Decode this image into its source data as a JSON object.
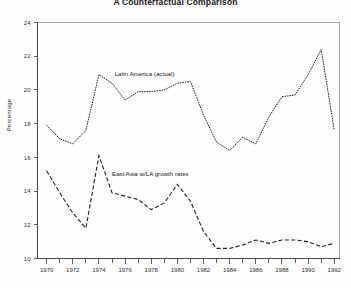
{
  "chart_data": {
    "type": "line",
    "title": "A Counterfactual Comparison",
    "xlabel": "",
    "ylabel": "Percentage",
    "xlim": [
      1969.3,
      1992.4
    ],
    "ylim": [
      10,
      24
    ],
    "grid": false,
    "legend_position": "inline-annotation",
    "x_tick_step_minor": 1,
    "x_tick_step_major": 2,
    "y_tick_step": 2,
    "xticks": [
      1970,
      1972,
      1974,
      1976,
      1978,
      1980,
      1982,
      1984,
      1986,
      1988,
      1990,
      1992
    ],
    "xtick_labels": [
      "1970",
      "1972",
      "1974",
      "1976",
      "1978",
      "1980",
      "1982",
      "1984",
      "1986",
      "1988",
      "1990",
      "1992"
    ],
    "yticks": [
      10,
      12,
      14,
      16,
      18,
      20,
      22,
      24
    ],
    "ytick_labels": [
      "10",
      "12",
      "14",
      "16",
      "18",
      "20",
      "22",
      "24"
    ],
    "x": [
      1970,
      1971,
      1972,
      1973,
      1974,
      1975,
      1976,
      1977,
      1978,
      1979,
      1980,
      1981,
      1982,
      1983,
      1984,
      1985,
      1986,
      1987,
      1988,
      1989,
      1990,
      1991,
      1992
    ],
    "series": [
      {
        "name": "Latin America (actual)",
        "style": "dotted",
        "annotation": "Latin America (actual)",
        "values": [
          17.9,
          17.1,
          16.8,
          17.6,
          20.9,
          20.4,
          19.4,
          19.9,
          19.9,
          20.0,
          20.4,
          20.5,
          18.5,
          16.9,
          16.4,
          17.2,
          16.8,
          18.4,
          19.6,
          19.7,
          20.9,
          22.4,
          17.6
        ]
      },
      {
        "name": "East Asia w/LA growth rates",
        "style": "dashed",
        "annotation": "East Asia w/LA growth rates",
        "values": [
          15.2,
          13.9,
          12.7,
          11.8,
          16.1,
          13.9,
          13.7,
          13.5,
          12.9,
          13.3,
          14.4,
          13.4,
          11.6,
          10.6,
          10.6,
          10.8,
          11.1,
          10.9,
          11.1,
          11.1,
          11.0,
          10.7,
          10.9
        ]
      }
    ],
    "annotations": [
      {
        "text": "Latin America (actual)",
        "x": 1975.2,
        "y": 20.8
      },
      {
        "text": "East Asia w/LA growth rates",
        "x": 1975.0,
        "y": 14.9
      }
    ]
  },
  "figure": {
    "background_color": "#fefefe",
    "line_color": "#1f1f1f",
    "axis_color": "#4a4a4a"
  }
}
